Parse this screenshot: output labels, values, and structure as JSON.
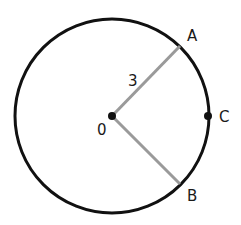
{
  "diagram": {
    "center": {
      "label": "0",
      "x": 112,
      "y": 116
    },
    "radius_label": "3",
    "points": [
      {
        "label": "A",
        "x": 180,
        "y": 46,
        "label_x": 187,
        "label_y": 41
      },
      {
        "label": "B",
        "x": 180,
        "y": 184,
        "label_x": 187,
        "label_y": 201
      },
      {
        "label": "C",
        "x": 208,
        "y": 116,
        "label_x": 219,
        "label_y": 121
      }
    ],
    "colors": {
      "circle": "#111111",
      "radius": "#9a9a9a",
      "dot": "#111111"
    }
  }
}
